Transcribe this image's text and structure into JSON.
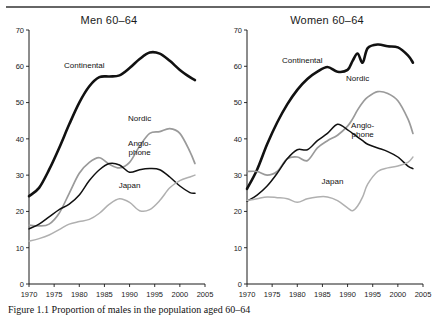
{
  "figure": {
    "caption": "Figure 1.1 Proportion of males in the population aged 60–64",
    "top_rule": true
  },
  "chart_data": [
    {
      "type": "line",
      "title": "Men 60–64",
      "xlabel": "",
      "ylabel": "",
      "xlim": [
        1970,
        2005
      ],
      "ylim": [
        0,
        70
      ],
      "xticks": [
        1970,
        1975,
        1980,
        1985,
        1990,
        1995,
        2000,
        2005
      ],
      "yticks": [
        0,
        10,
        20,
        30,
        40,
        50,
        60,
        70
      ],
      "grid": false,
      "legend": "inline-annotations",
      "x": [
        1970,
        1972,
        1974,
        1976,
        1978,
        1980,
        1982,
        1984,
        1986,
        1988,
        1990,
        1992,
        1994,
        1996,
        1998,
        2000,
        2002,
        2003
      ],
      "series": [
        {
          "name": "Continental",
          "color": "#111111",
          "label_x": 1981,
          "label_y": 59.5,
          "values": [
            24.2,
            26.5,
            31.5,
            37.5,
            44.0,
            50.0,
            54.5,
            57.0,
            57.2,
            57.5,
            59.5,
            62.0,
            63.8,
            63.5,
            61.5,
            59.0,
            57.0,
            56.2
          ]
        },
        {
          "name": "Nordic",
          "color": "#9a9a9a",
          "label_x": 1992,
          "label_y": 45.0,
          "values": [
            16.2,
            16.0,
            16.5,
            19.5,
            25.0,
            30.5,
            33.5,
            34.8,
            33.0,
            32.0,
            33.5,
            38.0,
            41.5,
            42.0,
            42.8,
            41.5,
            36.5,
            33.2
          ]
        },
        {
          "name": "Anglo-phone",
          "color": "#111111",
          "label_x": 1992,
          "label_y": 38.0,
          "values": [
            15.2,
            16.5,
            18.5,
            20.5,
            22.0,
            24.5,
            28.5,
            31.5,
            33.2,
            32.8,
            30.8,
            31.5,
            31.8,
            31.5,
            29.5,
            27.0,
            25.2,
            25.0
          ]
        },
        {
          "name": "Japan",
          "color": "#b0b0b0",
          "label_x": 1990,
          "label_y": 26.5,
          "values": [
            11.8,
            12.5,
            13.5,
            15.0,
            16.5,
            17.2,
            17.8,
            19.5,
            22.0,
            23.5,
            22.5,
            20.2,
            20.5,
            23.0,
            26.5,
            28.5,
            29.5,
            30.0
          ]
        }
      ]
    },
    {
      "type": "line",
      "title": "Women 60–64",
      "xlabel": "",
      "ylabel": "",
      "xlim": [
        1970,
        2005
      ],
      "ylim": [
        0,
        70
      ],
      "xticks": [
        1970,
        1975,
        1980,
        1985,
        1990,
        1995,
        2000,
        2005
      ],
      "yticks": [
        0,
        10,
        20,
        30,
        40,
        50,
        60,
        70
      ],
      "grid": false,
      "legend": "inline-annotations",
      "x": [
        1970,
        1972,
        1974,
        1976,
        1978,
        1980,
        1982,
        1984,
        1986,
        1988,
        1990,
        1991,
        1992,
        1993,
        1994,
        1996,
        1998,
        2000,
        2002,
        2003
      ],
      "series": [
        {
          "name": "Continental",
          "color": "#111111",
          "label_x": 1981,
          "label_y": 61.0,
          "values": [
            26.2,
            31.5,
            38.5,
            44.5,
            49.5,
            53.5,
            56.5,
            58.5,
            59.8,
            58.5,
            59.0,
            61.5,
            63.5,
            61.0,
            65.0,
            66.0,
            65.5,
            65.2,
            63.0,
            61.0
          ]
        },
        {
          "name": "Nordic",
          "color": "#9a9a9a",
          "label_x": 1992,
          "label_y": 56.0,
          "values": [
            31.0,
            31.0,
            30.0,
            31.0,
            34.5,
            35.0,
            34.0,
            37.5,
            39.5,
            41.0,
            43.5,
            45.5,
            48.0,
            50.0,
            51.5,
            53.0,
            52.5,
            50.5,
            45.5,
            41.5
          ]
        },
        {
          "name": "Anglo-phone",
          "color": "#111111",
          "label_x": 1993,
          "label_y": 43.0,
          "values": [
            22.8,
            24.5,
            27.0,
            30.5,
            34.5,
            37.0,
            37.0,
            39.5,
            41.5,
            44.0,
            42.5,
            41.5,
            40.5,
            39.5,
            38.5,
            37.5,
            36.5,
            35.0,
            32.5,
            31.8
          ]
        },
        {
          "name": "Japan",
          "color": "#b0b0b0",
          "label_x": 1987,
          "label_y": 27.5,
          "values": [
            23.0,
            23.5,
            24.0,
            23.8,
            23.5,
            22.5,
            23.5,
            24.0,
            24.0,
            23.0,
            21.0,
            20.2,
            21.5,
            24.0,
            27.5,
            31.0,
            32.0,
            32.5,
            33.5,
            35.0
          ]
        }
      ]
    }
  ]
}
